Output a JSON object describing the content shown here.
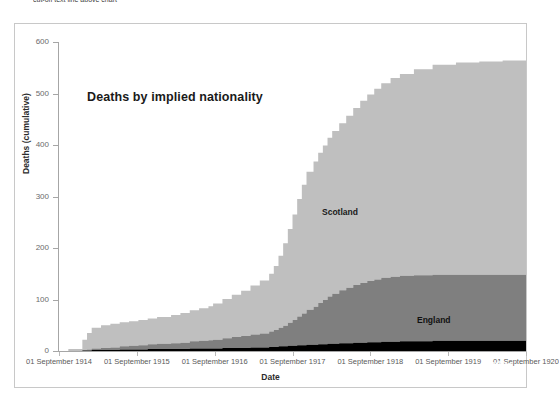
{
  "top_fragment": "cut-off text line above chart",
  "chart": {
    "title": "Deaths by implied nationality",
    "x_axis_title": "Date",
    "y_axis_title": "Deaths (cumulative)",
    "y_ticks": [
      "0",
      "100",
      "200",
      "300",
      "400",
      "500",
      "600"
    ],
    "x_ticks": [
      "01 September 1914",
      "01 September 1915",
      "01 September 1916",
      "01 September 1917",
      "01 September 1918",
      "01 September 1919",
      "01 September 1920"
    ],
    "series_labels": {
      "scotland": "Scotland",
      "england": "England",
      "other": "Other"
    },
    "colors": {
      "scotland": "#bfbfbf",
      "england": "#7f7f7f",
      "other": "#000000",
      "axis": "#a6a6a6",
      "frame": "#c8c8c8",
      "tick_text": "#6b6b6b",
      "title_text": "#1a1a1a"
    }
  },
  "chart_data": {
    "type": "area",
    "stacked": true,
    "title": "Deaths by implied nationality",
    "xlabel": "Date",
    "ylabel": "Deaths (cumulative)",
    "ylim": [
      0,
      600
    ],
    "grid": false,
    "legend": "inline-labels",
    "x_tick_labels": [
      "01 September 1914",
      "01 September 1915",
      "01 September 1916",
      "01 September 1917",
      "01 September 1918",
      "01 September 1919",
      "01 September 1920"
    ],
    "x_tick_fractions": [
      0.0,
      0.1667,
      0.3333,
      0.5,
      0.6667,
      0.8333,
      1.0
    ],
    "note": "x values expressed as fraction of the plotted date span (01 Sep 1914 = 0.0, 01 Sep 1920 = 1.0). Values are cumulative deaths read off the axis.",
    "x": [
      0.0,
      0.02,
      0.05,
      0.06,
      0.07,
      0.09,
      0.11,
      0.13,
      0.15,
      0.17,
      0.19,
      0.21,
      0.24,
      0.26,
      0.28,
      0.3,
      0.32,
      0.33,
      0.35,
      0.37,
      0.39,
      0.41,
      0.43,
      0.45,
      0.46,
      0.47,
      0.48,
      0.49,
      0.5,
      0.51,
      0.52,
      0.53,
      0.545,
      0.555,
      0.565,
      0.575,
      0.585,
      0.6,
      0.615,
      0.63,
      0.645,
      0.66,
      0.675,
      0.69,
      0.71,
      0.73,
      0.76,
      0.8,
      0.85,
      0.9,
      0.95,
      1.0
    ],
    "series": [
      {
        "name": "Other",
        "color": "#000000",
        "values": [
          0,
          0,
          1,
          1,
          2,
          2,
          2,
          3,
          3,
          3,
          4,
          4,
          4,
          4,
          5,
          5,
          5,
          5,
          6,
          6,
          6,
          7,
          7,
          8,
          8,
          9,
          9,
          10,
          10,
          11,
          11,
          12,
          12,
          13,
          13,
          14,
          14,
          15,
          15,
          16,
          16,
          17,
          17,
          18,
          18,
          19,
          19,
          20,
          20,
          20,
          20,
          20
        ]
      },
      {
        "name": "England",
        "color": "#7f7f7f",
        "values": [
          0,
          0,
          1,
          2,
          3,
          4,
          5,
          6,
          7,
          8,
          9,
          10,
          11,
          12,
          14,
          15,
          16,
          17,
          19,
          21,
          23,
          25,
          27,
          30,
          33,
          36,
          40,
          45,
          50,
          56,
          62,
          68,
          74,
          80,
          86,
          92,
          97,
          103,
          108,
          112,
          116,
          119,
          122,
          124,
          126,
          127,
          128,
          128,
          128,
          128,
          128,
          128
        ]
      },
      {
        "name": "Scotland",
        "color": "#bfbfbf",
        "values": [
          0,
          4,
          20,
          32,
          40,
          44,
          46,
          47,
          48,
          49,
          50,
          52,
          55,
          58,
          60,
          63,
          66,
          70,
          76,
          82,
          88,
          95,
          103,
          112,
          124,
          140,
          160,
          182,
          205,
          228,
          250,
          268,
          282,
          292,
          300,
          308,
          316,
          324,
          334,
          344,
          354,
          362,
          370,
          378,
          386,
          392,
          400,
          408,
          412,
          414,
          416,
          417
        ]
      }
    ],
    "totals_endpoint": 565,
    "band_tops_at_end": {
      "other": 20,
      "england": 148,
      "scotland": 565
    }
  }
}
